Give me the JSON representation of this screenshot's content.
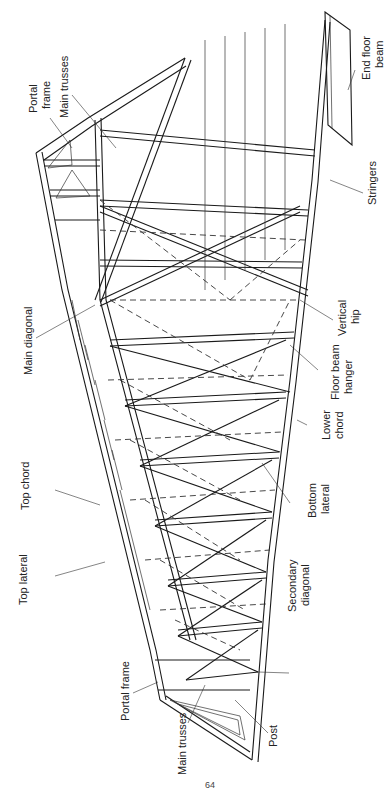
{
  "figure": {
    "orientation": "rotated 90 degrees (labels read bottom-to-top)",
    "labels": [
      {
        "id": "portal-frame-top",
        "text": [
          "Portal",
          "frame"
        ]
      },
      {
        "id": "main-trusses-top",
        "text": [
          "Main trusses"
        ]
      },
      {
        "id": "main-diagonal",
        "text": [
          "Main diagonal"
        ]
      },
      {
        "id": "top-chord",
        "text": [
          "Top chord"
        ]
      },
      {
        "id": "top-lateral",
        "text": [
          "Top lateral"
        ]
      },
      {
        "id": "portal-frame-bottom",
        "text": [
          "Portal frame"
        ]
      },
      {
        "id": "main-trusses-bottom",
        "text": [
          "Main trusses"
        ]
      },
      {
        "id": "post",
        "text": [
          "Post"
        ]
      },
      {
        "id": "secondary-diagonal",
        "text": [
          "Secondary",
          "diagonal"
        ]
      },
      {
        "id": "bottom-lateral",
        "text": [
          "Bottom",
          "lateral"
        ]
      },
      {
        "id": "lower-chord",
        "text": [
          "Lower",
          "chord"
        ]
      },
      {
        "id": "floor-beam-hanger",
        "text": [
          "Floor beam",
          "hanger"
        ]
      },
      {
        "id": "vertical-hip",
        "text": [
          "Vertical",
          "hip"
        ]
      },
      {
        "id": "stringers",
        "text": [
          "Stringers"
        ]
      },
      {
        "id": "end-floor-beam",
        "text": [
          "End floor",
          "beam"
        ]
      }
    ],
    "page_number": "64"
  }
}
